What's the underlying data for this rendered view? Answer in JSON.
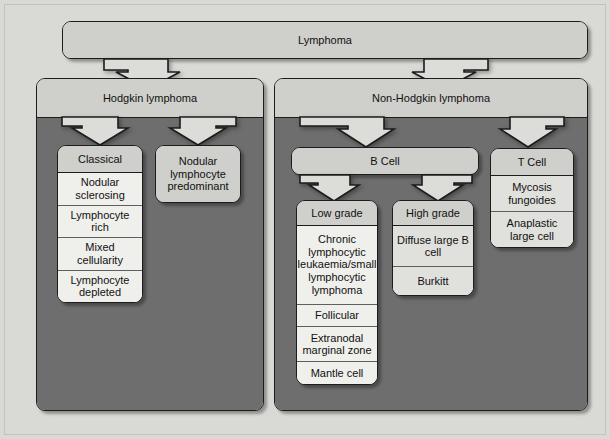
{
  "diagram": {
    "colors": {
      "canvas_background": "#d9d9d5",
      "node_fill": "#cfcfcb",
      "panel_body": "#6e6e6e",
      "leaf_fill": "#efefec",
      "outline": "#1c1c1c",
      "arrow_fill": "#dcdcd8"
    },
    "root": {
      "label": "Lymphoma"
    },
    "hodgkin": {
      "label": "Hodgkin lymphoma",
      "classical": {
        "label": "Classical",
        "subtypes": [
          "Nodular sclerosing",
          "Lymphocyte rich",
          "Mixed cellularity",
          "Lymphocyte depleted"
        ]
      },
      "nodular_lymphocyte_predominant": {
        "label": "Nodular lymphocyte predominant"
      }
    },
    "non_hodgkin": {
      "label": "Non-Hodgkin lymphoma",
      "b_cell": {
        "label": "B Cell",
        "low_grade": {
          "label": "Low grade",
          "subtypes": [
            "Chronic lymphocytic leukaemia/small lymphocytic lymphoma",
            "Follicular",
            "Extranodal marginal zone",
            "Mantle cell"
          ]
        },
        "high_grade": {
          "label": "High grade",
          "subtypes": [
            "Diffuse large B cell",
            "Burkitt"
          ]
        }
      },
      "t_cell": {
        "label": "T Cell",
        "subtypes": [
          "Mycosis fungoides",
          "Anaplastic large cell"
        ]
      }
    },
    "arrows": [
      {
        "name": "lymphoma-to-hodgkin"
      },
      {
        "name": "lymphoma-to-non-hodgkin"
      },
      {
        "name": "hodgkin-to-classical"
      },
      {
        "name": "hodgkin-to-nodular-lymphocyte-predominant"
      },
      {
        "name": "non-hodgkin-to-b-cell"
      },
      {
        "name": "non-hodgkin-to-t-cell"
      },
      {
        "name": "b-cell-to-low-grade"
      },
      {
        "name": "b-cell-to-high-grade"
      }
    ]
  }
}
